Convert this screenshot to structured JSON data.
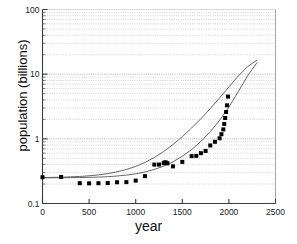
{
  "chart_data": {
    "type": "line",
    "title": "",
    "subtitle": "",
    "xlabel": "year",
    "ylabel": "population (billions)",
    "xlim": [
      0,
      2500
    ],
    "ylim": [
      0.1,
      100
    ],
    "yscale": "log",
    "xscale": "linear",
    "grid": true,
    "grid_orientation": "horizontal",
    "grid_style": "dotted",
    "grid_color": "#bfbfbf",
    "legend": false,
    "legend_position": "none",
    "xticks": [
      0,
      500,
      1000,
      1500,
      2000,
      2500
    ],
    "xticklabels": [
      "0",
      "500",
      "1000",
      "1500",
      "2000",
      "2500"
    ],
    "yticks": [
      0.1,
      1,
      10,
      100
    ],
    "yticklabels": [
      "0.1",
      "1",
      "10",
      "100"
    ],
    "yminorticks": [
      0.2,
      0.3,
      0.4,
      0.5,
      0.6,
      0.7,
      0.8,
      0.9,
      2,
      3,
      4,
      5,
      6,
      7,
      8,
      9,
      20,
      30,
      40,
      50,
      60,
      70,
      80,
      90
    ],
    "series": [
      {
        "name": "model-curve-upper",
        "type": "line",
        "color": "#555555",
        "linewidth": 0.9,
        "x": [
          0,
          100,
          200,
          300,
          400,
          500,
          600,
          700,
          800,
          900,
          1000,
          1100,
          1200,
          1300,
          1400,
          1500,
          1600,
          1700,
          1800,
          1900,
          2000,
          2100,
          2200,
          2300
        ],
        "y": [
          0.252,
          0.253,
          0.255,
          0.258,
          0.262,
          0.268,
          0.277,
          0.29,
          0.309,
          0.336,
          0.375,
          0.432,
          0.515,
          0.637,
          0.818,
          1.08,
          1.47,
          2.05,
          2.93,
          4.28,
          6.35,
          9.35,
          13.1,
          16.4
        ]
      },
      {
        "name": "model-curve-lower",
        "type": "line",
        "color": "#555555",
        "linewidth": 0.9,
        "x": [
          0,
          100,
          200,
          300,
          400,
          500,
          600,
          700,
          800,
          900,
          1000,
          1100,
          1200,
          1300,
          1400,
          1500,
          1600,
          1700,
          1800,
          1900,
          2000,
          2100,
          2200,
          2300
        ],
        "y": [
          0.25,
          0.25,
          0.25,
          0.251,
          0.252,
          0.254,
          0.256,
          0.26,
          0.266,
          0.275,
          0.288,
          0.307,
          0.336,
          0.378,
          0.442,
          0.537,
          0.683,
          0.912,
          1.29,
          1.93,
          3.1,
          5.35,
          9.4,
          15.0
        ]
      },
      {
        "name": "observed-population-data",
        "type": "scatter",
        "marker": "square",
        "color": "#000000",
        "markersize": 4,
        "x": [
          0,
          200,
          400,
          500,
          600,
          700,
          800,
          900,
          1000,
          1100,
          1200,
          1250,
          1300,
          1310,
          1320,
          1330,
          1340,
          1400,
          1500,
          1600,
          1650,
          1700,
          1750,
          1800,
          1850,
          1900,
          1920,
          1940,
          1950,
          1960,
          1970,
          1980,
          1990
        ],
        "y": [
          0.255,
          0.257,
          0.206,
          0.205,
          0.206,
          0.207,
          0.213,
          0.214,
          0.226,
          0.265,
          0.4,
          0.4,
          0.42,
          0.43,
          0.432,
          0.425,
          0.418,
          0.375,
          0.44,
          0.54,
          0.545,
          0.6,
          0.65,
          0.79,
          0.9,
          1.02,
          1.18,
          1.4,
          1.7,
          2.1,
          2.6,
          3.3,
          4.5
        ]
      }
    ]
  },
  "axes": {
    "x_title": "year",
    "y_title": "population (billions)"
  }
}
